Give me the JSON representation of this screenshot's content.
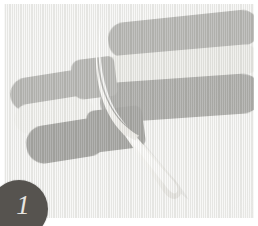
{
  "image": {
    "title": "Butter knife on striped gray fabric",
    "width": 258,
    "height": 226,
    "frame_color": "#ffffff",
    "backdrop_color": "#f2f2f0"
  },
  "badge": {
    "name": "step-number-badge",
    "number": "1",
    "fill_color": "#56534f",
    "text_color": "#e8e6e2"
  },
  "palette": {
    "dark_gray": "#8d8d89",
    "mid_gray": "#7d7d79",
    "deep_gray": "#6f6f6b",
    "light_gray": "#e3e3de",
    "pale_gray": "#edede9",
    "knife_body": "#f6f5f1",
    "knife_shadow": "#d9d8d2",
    "backdrop": "#f2f2f0"
  },
  "objects": {
    "knife": {
      "name": "butter-knife",
      "description": "light gray butter knife angled from upper-left to lower-right",
      "body_color": "#f6f5f1",
      "edge_color": "#d9d8d2"
    },
    "bands": [
      {
        "id": "right-top",
        "label": "dark gray band",
        "color": "#8d8d89",
        "x": 108,
        "y": 18,
        "w": 148,
        "h": 34,
        "rotate": -6
      },
      {
        "id": "right-middle",
        "label": "light gray band",
        "color": "#e3e3de",
        "x": 104,
        "y": 50,
        "w": 152,
        "h": 30,
        "rotate": -5
      },
      {
        "id": "right-bottom",
        "label": "mid gray band",
        "color": "#7d7d79",
        "x": 100,
        "y": 78,
        "w": 158,
        "h": 36,
        "rotate": -4
      },
      {
        "id": "left-top",
        "label": "dark gray band",
        "color": "#8d8d89",
        "x": 8,
        "y": 74,
        "w": 72,
        "h": 32,
        "rotate": -8
      },
      {
        "id": "left-middle",
        "label": "pale gray band",
        "color": "#edede9",
        "x": 12,
        "y": 100,
        "w": 72,
        "h": 28,
        "rotate": -8
      },
      {
        "id": "left-bottom",
        "label": "deep gray band",
        "color": "#6f6f6b",
        "x": 26,
        "y": 122,
        "w": 72,
        "h": 34,
        "rotate": -8
      },
      {
        "id": "center-top",
        "label": "dark gray square",
        "color": "#8d8d89",
        "x": 70,
        "y": 58,
        "w": 38,
        "h": 34,
        "rotate": -7
      },
      {
        "id": "center-bottom",
        "label": "deep gray square",
        "color": "#6f6f6b",
        "x": 88,
        "y": 108,
        "w": 50,
        "h": 38,
        "rotate": -7
      }
    ]
  }
}
